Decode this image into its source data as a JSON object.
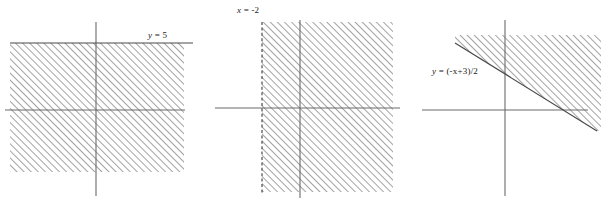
{
  "figure": {
    "width": 612,
    "height": 205,
    "background_color": "#ffffff",
    "axis_color": "#6b6b6b",
    "boundary_color": "#4a4a4a",
    "hatch_color": "#555555",
    "label_color": "#1a1a1a"
  },
  "panels": [
    {
      "id": "panel-1",
      "name": "horizontal-boundary-graph",
      "label": "y = 5",
      "label_var": "y",
      "label_rest": " = 5",
      "label_x": 148,
      "label_y": 30,
      "boundary_type": "horizontal",
      "boundary_style": "solid",
      "shaded_side": "below",
      "origin": {
        "x": 96,
        "y": 110
      },
      "x_axis": {
        "x1": 5,
        "x2": 185,
        "y": 110
      },
      "y_axis": {
        "x": 96,
        "y1": 22,
        "y2": 196
      },
      "boundary_line": {
        "x1": 10,
        "y1": 43,
        "x2": 193,
        "y2": 43
      },
      "region": {
        "x": 10,
        "y": 43,
        "width": 174,
        "height": 129
      }
    },
    {
      "id": "panel-2",
      "name": "vertical-boundary-graph",
      "label": "x = -2",
      "label_var": "x",
      "label_rest": " = -2",
      "label_x": 237,
      "label_y": 5,
      "boundary_type": "vertical",
      "boundary_style": "dashed",
      "shaded_side": "right",
      "origin": {
        "x": 300,
        "y": 108
      },
      "x_axis": {
        "x1": 215,
        "x2": 400,
        "y": 108
      },
      "y_axis": {
        "x": 300,
        "y1": 20,
        "y2": 198
      },
      "boundary_line": {
        "x1": 262,
        "y1": 22,
        "x2": 262,
        "y2": 194
      },
      "region": {
        "x": 262,
        "y": 22,
        "width": 131,
        "height": 170
      }
    },
    {
      "id": "panel-3",
      "name": "diagonal-boundary-graph",
      "label": "y = (-x+3)/2",
      "label_var": "y",
      "label_rest": " = (-x+3)/2",
      "label_x": 432,
      "label_y": 66,
      "boundary_type": "diagonal",
      "boundary_style": "solid",
      "shaded_side": "above",
      "slope": -0.5,
      "origin": {
        "x": 505,
        "y": 110
      },
      "x_axis": {
        "x1": 422,
        "x2": 588,
        "y": 110
      },
      "y_axis": {
        "x": 505,
        "y1": 20,
        "y2": 196
      },
      "boundary_line": {
        "x1": 455,
        "y1": 43,
        "x2": 597,
        "y2": 131
      },
      "region_points": "455,43 597,131 601,131 601,35 455,35",
      "x_intercept_x": 573,
      "top_edge_y": 35,
      "right_edge_x": 601
    }
  ]
}
